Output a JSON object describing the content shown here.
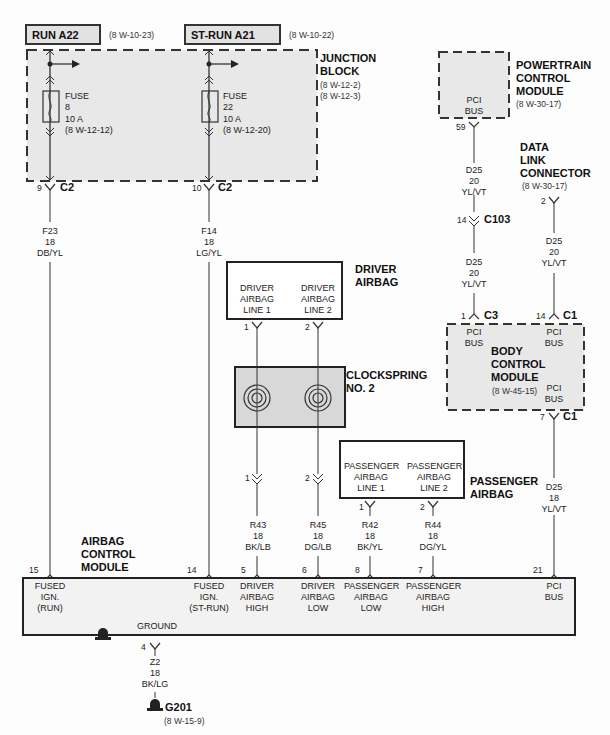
{
  "sources": [
    {
      "label": "RUN A22",
      "ref": "(8 W-10-23)"
    },
    {
      "label": "ST-RUN A21",
      "ref": "(8 W-10-22)"
    }
  ],
  "junction_block": {
    "title_line1": "JUNCTION",
    "title_line2": "BLOCK",
    "ref1": "(8 W-12-2)",
    "ref2": "(8 W-12-3)",
    "fuses": [
      {
        "label": "FUSE",
        "number": "8",
        "rating": "10 A",
        "ref": "(8 W-12-12)"
      },
      {
        "label": "FUSE",
        "number": "22",
        "rating": "10 A",
        "ref": "(8 W-12-20)"
      }
    ],
    "outputs": [
      {
        "pin": "9",
        "connector": "C2"
      },
      {
        "pin": "10",
        "connector": "C2"
      }
    ]
  },
  "wires": {
    "f23": {
      "circuit": "F23",
      "gauge": "18",
      "color": "DB/YL"
    },
    "f14": {
      "circuit": "F14",
      "gauge": "18",
      "color": "LG/YL"
    },
    "d25_pcm_top": {
      "circuit": "D25",
      "gauge": "20",
      "color": "YL/VT"
    },
    "d25_pcm_bottom": {
      "circuit": "D25",
      "gauge": "20",
      "color": "YL/VT"
    },
    "d25_dlc": {
      "circuit": "D25",
      "gauge": "20",
      "color": "YL/VT"
    },
    "d25_bcm": {
      "circuit": "D25",
      "gauge": "18",
      "color": "YL/VT"
    },
    "r43": {
      "circuit": "R43",
      "gauge": "18",
      "color": "BK/LB"
    },
    "r45": {
      "circuit": "R45",
      "gauge": "18",
      "color": "DG/LB"
    },
    "r42": {
      "circuit": "R42",
      "gauge": "18",
      "color": "BK/YL"
    },
    "r44": {
      "circuit": "R44",
      "gauge": "18",
      "color": "DG/YL"
    },
    "z2": {
      "circuit": "Z2",
      "gauge": "18",
      "color": "BK/LG"
    }
  },
  "pcm": {
    "title_line1": "POWERTRAIN",
    "title_line2": "CONTROL",
    "title_line3": "MODULE",
    "ref": "(8 W-30-17)",
    "terminal_line1": "PCI",
    "terminal_line2": "BUS",
    "pin": "59"
  },
  "c103": {
    "pin": "14",
    "connector": "C103"
  },
  "dlc": {
    "title_line1": "DATA",
    "title_line2": "LINK",
    "title_line3": "CONNECTOR",
    "ref": "(8 W-30-17)",
    "pin": "2"
  },
  "bcm": {
    "title_line1": "BODY",
    "title_line2": "CONTROL",
    "title_line3": "MODULE",
    "ref": "(8 W-45-15)",
    "terminals": [
      {
        "line1": "PCI",
        "line2": "BUS",
        "pin": "1",
        "connector": "C3"
      },
      {
        "line1": "PCI",
        "line2": "BUS",
        "pin": "14",
        "connector": "C1"
      },
      {
        "line1": "PCI",
        "line2": "BUS",
        "pin": "7",
        "connector": "C1"
      }
    ]
  },
  "driver_airbag": {
    "title_line1": "DRIVER",
    "title_line2": "AIRBAG",
    "terminals": [
      {
        "line1": "DRIVER",
        "line2": "AIRBAG",
        "line3": "LINE 1",
        "pin": "1"
      },
      {
        "line1": "DRIVER",
        "line2": "AIRBAG",
        "line3": "LINE 2",
        "pin": "2"
      }
    ]
  },
  "clockspring": {
    "title_line1": "CLOCKSPRING",
    "title_line2": "NO. 2",
    "out_pins": [
      "1",
      "2"
    ]
  },
  "passenger_airbag": {
    "title_line1": "PASSENGER",
    "title_line2": "AIRBAG",
    "terminals": [
      {
        "line1": "PASSENGER",
        "line2": "AIRBAG",
        "line3": "LINE 1",
        "pin": "1"
      },
      {
        "line1": "PASSENGER",
        "line2": "AIRBAG",
        "line3": "LINE 2",
        "pin": "2"
      }
    ]
  },
  "acm": {
    "title_line1": "AIRBAG",
    "title_line2": "CONTROL",
    "title_line3": "MODULE",
    "ground_label": "GROUND",
    "ground_pin": "4",
    "terminals": [
      {
        "pin": "15",
        "line1": "FUSED",
        "line2": "IGN.",
        "line3": "(RUN)"
      },
      {
        "pin": "14",
        "line1": "FUSED",
        "line2": "IGN.",
        "line3": "(ST-RUN)"
      },
      {
        "pin": "5",
        "line1": "DRIVER",
        "line2": "AIRBAG",
        "line3": "HIGH"
      },
      {
        "pin": "6",
        "line1": "DRIVER",
        "line2": "AIRBAG",
        "line3": "LOW"
      },
      {
        "pin": "8",
        "line1": "PASSENGER",
        "line2": "AIRBAG",
        "line3": "LOW"
      },
      {
        "pin": "7",
        "line1": "PASSENGER",
        "line2": "AIRBAG",
        "line3": "HIGH"
      },
      {
        "pin": "21",
        "line1": "PCI",
        "line2": "BUS",
        "line3": ""
      }
    ]
  },
  "ground": {
    "label": "G201",
    "ref": "(8 W-15-9)"
  },
  "colors": {
    "line": "#333333",
    "box_fill": "#e4e4e4",
    "text": "#222222"
  }
}
